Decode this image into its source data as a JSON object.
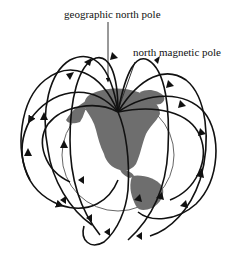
{
  "diagram": {
    "labels": {
      "geographic_north_pole": "geographic north pole",
      "north_magnetic_pole": "north magnetic pole"
    },
    "elements": {
      "globe": {
        "description": "Earth globe showing North and South America",
        "land_color": "#6e6e6e",
        "outline_color": "#555555"
      },
      "field_lines": {
        "description": "Magnetic field lines looping around Earth with arrows pointing toward the north magnetic pole",
        "color": "#111111",
        "count": 10
      }
    }
  }
}
